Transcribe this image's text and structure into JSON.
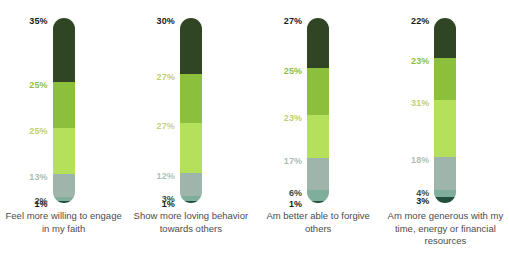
{
  "chart_data": {
    "type": "bar",
    "subtype": "stacked-bar",
    "title": "",
    "xlabel": "",
    "ylabel": "",
    "ylim": [
      0,
      100
    ],
    "grid": false,
    "legend": "none",
    "orientation": "vertical",
    "stack_order": "top-to-bottom",
    "categories": [
      "Feel more willing to engage in my faith",
      "Show more loving behavior towards others",
      "Am better able to forgive others",
      "Am more generous with my time, energy or financial resources"
    ],
    "series": [
      {
        "name": "segment-1",
        "color": "#2f4524",
        "values": [
          35,
          30,
          27,
          22
        ]
      },
      {
        "name": "segment-2",
        "color": "#8cc03c",
        "values": [
          25,
          27,
          25,
          23
        ]
      },
      {
        "name": "segment-3",
        "color": "#b5e05c",
        "values": [
          25,
          27,
          23,
          31
        ]
      },
      {
        "name": "segment-4",
        "color": "#9fb5ab",
        "values": [
          13,
          12,
          17,
          18
        ]
      },
      {
        "name": "segment-5",
        "color": "#7fae9c",
        "values": [
          2,
          3,
          6,
          4
        ]
      },
      {
        "name": "segment-6",
        "color": "#22503c",
        "values": [
          1,
          1,
          1,
          3
        ]
      }
    ]
  },
  "columns": [
    {
      "caption": "Feel more willing to engage in my faith",
      "segments": [
        {
          "label": "35%",
          "value": 35,
          "color": "#2f4524",
          "label_color": "#1b1b1b"
        },
        {
          "label": "25%",
          "value": 25,
          "color": "#8cc03c",
          "label_color": "#8cbf3f"
        },
        {
          "label": "25%",
          "value": 25,
          "color": "#b5e05c",
          "label_color": "#c2cf73"
        },
        {
          "label": "13%",
          "value": 13,
          "color": "#9fb5ab",
          "label_color": "#a9c0b5"
        },
        {
          "label": "2%",
          "value": 2,
          "color": "#7fae9c",
          "label_color": "#3d4a45"
        },
        {
          "label": "1%",
          "value": 1,
          "color": "#22503c",
          "label_color": "#1b1b1b"
        }
      ]
    },
    {
      "caption": "Show more loving behavior towards others",
      "segments": [
        {
          "label": "30%",
          "value": 30,
          "color": "#2f4524",
          "label_color": "#1b1b1b"
        },
        {
          "label": "27%",
          "value": 27,
          "color": "#8cc03c",
          "label_color": "#c2cf73"
        },
        {
          "label": "27%",
          "value": 27,
          "color": "#b5e05c",
          "label_color": "#c8d47d"
        },
        {
          "label": "12%",
          "value": 12,
          "color": "#9fb5ab",
          "label_color": "#adc2b8"
        },
        {
          "label": "3%",
          "value": 3,
          "color": "#7fae9c",
          "label_color": "#3d4a45"
        },
        {
          "label": "1%",
          "value": 1,
          "color": "#22503c",
          "label_color": "#1b1b1b"
        }
      ]
    },
    {
      "caption": "Am better able to forgive others",
      "segments": [
        {
          "label": "27%",
          "value": 27,
          "color": "#2f4524",
          "label_color": "#1b1b1b"
        },
        {
          "label": "25%",
          "value": 25,
          "color": "#8cc03c",
          "label_color": "#8cbf3f"
        },
        {
          "label": "23%",
          "value": 23,
          "color": "#b5e05c",
          "label_color": "#c2cf73"
        },
        {
          "label": "17%",
          "value": 17,
          "color": "#9fb5ab",
          "label_color": "#a9c0b5"
        },
        {
          "label": "6%",
          "value": 6,
          "color": "#7fae9c",
          "label_color": "#3d4a45"
        },
        {
          "label": "1%",
          "value": 1,
          "color": "#22503c",
          "label_color": "#1b1b1b"
        }
      ]
    },
    {
      "caption": "Am more generous with my time, energy or financial resources",
      "segments": [
        {
          "label": "22%",
          "value": 22,
          "color": "#2f4524",
          "label_color": "#1b1b1b"
        },
        {
          "label": "23%",
          "value": 23,
          "color": "#8cc03c",
          "label_color": "#8cbf3f"
        },
        {
          "label": "31%",
          "value": 31,
          "color": "#b5e05c",
          "label_color": "#c2cf73"
        },
        {
          "label": "18%",
          "value": 18,
          "color": "#9fb5ab",
          "label_color": "#adc2b8"
        },
        {
          "label": "4%",
          "value": 4,
          "color": "#7fae9c",
          "label_color": "#3d4a45"
        },
        {
          "label": "3%",
          "value": 3,
          "color": "#22503c",
          "label_color": "#1b1b1b"
        }
      ]
    }
  ],
  "footnote": ""
}
